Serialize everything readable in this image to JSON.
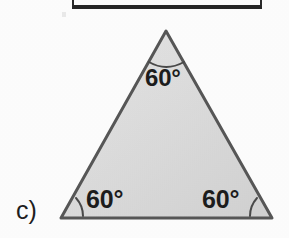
{
  "figure": {
    "part_label": "c)",
    "shape_name": "equilateral-triangle",
    "fill_color": "#dcdcdc",
    "stroke_color": "#575757",
    "rule_color": "#262626",
    "angles": [
      {
        "id": "apex",
        "label": "60°",
        "value": 60,
        "position": "top-vertex"
      },
      {
        "id": "bottom-left",
        "label": "60°",
        "value": 60,
        "position": "bottom-left-vertex"
      },
      {
        "id": "bottom-right",
        "label": "60°",
        "value": 60,
        "position": "bottom-right-vertex"
      }
    ],
    "vertices": {
      "apex": [
        166,
        31
      ],
      "bottom_left": [
        61,
        218
      ],
      "bottom_right": [
        272,
        218
      ]
    }
  }
}
